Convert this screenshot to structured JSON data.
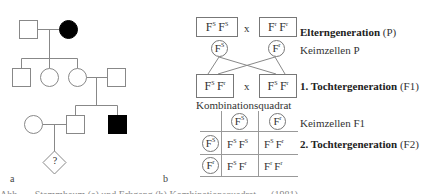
{
  "panel_a": {
    "letter": "a",
    "unknown_symbol": "?",
    "legend": {
      "square": "male",
      "circle": "female",
      "filled": "affected",
      "diamond": "unknown sex"
    }
  },
  "panel_b": {
    "letter": "b",
    "cross_symbol": "x",
    "parents": {
      "left": {
        "base": "F",
        "a1": "S",
        "a2": "S"
      },
      "right": {
        "base": "F",
        "a1": "r",
        "a2": "r"
      }
    },
    "gametes_p": {
      "left": {
        "base": "F",
        "sup": "S"
      },
      "right": {
        "base": "F",
        "sup": "r"
      }
    },
    "f1": {
      "left": {
        "base": "F",
        "a1": "S",
        "a2": "r"
      },
      "right": {
        "base": "F",
        "a1": "S",
        "a2": "r"
      }
    },
    "labels": {
      "p_bold": "Elterngeneration",
      "p_suffix": " (P)",
      "gametes_p": "Keimzellen P",
      "f1_bold": "1. Tochtergeneration",
      "f1_suffix": " (F1)",
      "punnett_title": "Kombinationsquadrat",
      "gametes_f1": "Keimzellen F1",
      "f2_bold": "2. Tochtergeneration",
      "f2_suffix": " (F2)"
    },
    "punnett": {
      "col_headers": [
        {
          "base": "F",
          "sup": "S"
        },
        {
          "base": "F",
          "sup": "r"
        }
      ],
      "row_headers": [
        {
          "base": "F",
          "sup": "S"
        },
        {
          "base": "F",
          "sup": "r"
        }
      ],
      "cells": [
        [
          {
            "a1": "S",
            "a2": "S"
          },
          {
            "a1": "S",
            "a2": "r"
          }
        ],
        [
          {
            "a1": "S",
            "a2": "r"
          },
          {
            "a1": "r",
            "a2": "r"
          }
        ]
      ]
    }
  },
  "caption": "Abb. — Stammbaum (a) und Erbgang (b) Kombinationsquadrat … (1981)"
}
